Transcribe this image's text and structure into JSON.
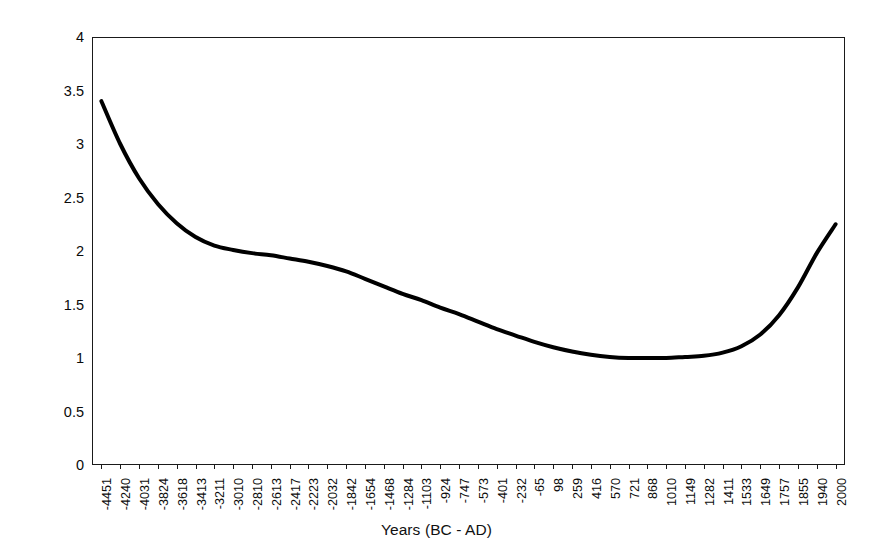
{
  "chart_data": {
    "type": "line",
    "title": "",
    "xlabel": "Years (BC - AD)",
    "ylabel": "Arboreal/NonArboreal Pollen %",
    "ylim": [
      0,
      4
    ],
    "ytick_labels": [
      "4",
      "3.5",
      "3",
      "2.5",
      "2",
      "1.5",
      "1",
      "0.5",
      "0"
    ],
    "ytick_values": [
      4,
      3.5,
      3,
      2.5,
      2,
      1.5,
      1,
      0.5,
      0
    ],
    "grid": false,
    "legend": false,
    "legend_position": "none",
    "line_color": "#000000",
    "line_width": 4,
    "categories": [
      "-4451",
      "-4240",
      "-4031",
      "-3824",
      "-3618",
      "-3413",
      "-3211",
      "-3010",
      "-2810",
      "-2613",
      "-2417",
      "-2223",
      "-2032",
      "-1842",
      "-1654",
      "-1468",
      "-1284",
      "-1103",
      "-924",
      "-747",
      "-573",
      "-401",
      "-232",
      "-65",
      "98",
      "259",
      "416",
      "570",
      "721",
      "868",
      "1010",
      "1149",
      "1282",
      "1411",
      "1533",
      "1649",
      "1757",
      "1855",
      "1940",
      "2000"
    ],
    "x": [
      -4451,
      -4240,
      -4031,
      -3824,
      -3618,
      -3413,
      -3211,
      -3010,
      -2810,
      -2613,
      -2417,
      -2223,
      -2032,
      -1842,
      -1654,
      -1468,
      -1284,
      -1103,
      -924,
      -747,
      -573,
      -401,
      -232,
      -65,
      98,
      259,
      416,
      570,
      721,
      868,
      1010,
      1149,
      1282,
      1411,
      1533,
      1649,
      1757,
      1855,
      1940,
      2000
    ],
    "values": [
      3.4,
      3.0,
      2.68,
      2.44,
      2.26,
      2.13,
      2.05,
      2.01,
      1.98,
      1.96,
      1.93,
      1.9,
      1.86,
      1.81,
      1.74,
      1.67,
      1.6,
      1.54,
      1.47,
      1.41,
      1.34,
      1.27,
      1.21,
      1.15,
      1.1,
      1.06,
      1.03,
      1.01,
      1.0,
      1.0,
      1.0,
      1.01,
      1.02,
      1.05,
      1.11,
      1.22,
      1.4,
      1.66,
      1.98,
      2.25
    ],
    "annotations": []
  },
  "axes": {
    "x_title": "Years (BC - AD)",
    "y_title": "Arboreal/NonArboreal Pollen %"
  }
}
